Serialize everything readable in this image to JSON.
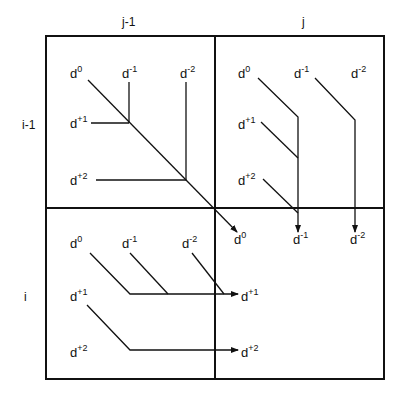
{
  "headers": {
    "columns": [
      "j-1",
      "j"
    ],
    "rows": [
      "i-1",
      "i"
    ]
  },
  "cells": {
    "top_left": {
      "labels": [
        {
          "base": "d",
          "sup": "0"
        },
        {
          "base": "d",
          "sup": "-1"
        },
        {
          "base": "d",
          "sup": "-2"
        },
        {
          "base": "d",
          "sup": "+1"
        },
        {
          "base": "d",
          "sup": "+2"
        }
      ]
    },
    "top_right": {
      "labels": [
        {
          "base": "d",
          "sup": "0"
        },
        {
          "base": "d",
          "sup": "-1"
        },
        {
          "base": "d",
          "sup": "-2"
        },
        {
          "base": "d",
          "sup": "+1"
        },
        {
          "base": "d",
          "sup": "+2"
        }
      ],
      "outputs": [
        {
          "base": "d",
          "sup": "0"
        },
        {
          "base": "d",
          "sup": "-1"
        },
        {
          "base": "d",
          "sup": "-2"
        }
      ]
    },
    "bottom_left": {
      "labels": [
        {
          "base": "d",
          "sup": "0"
        },
        {
          "base": "d",
          "sup": "-1"
        },
        {
          "base": "d",
          "sup": "-2"
        },
        {
          "base": "d",
          "sup": "+1"
        },
        {
          "base": "d",
          "sup": "+2"
        }
      ],
      "outputs": [
        {
          "base": "d",
          "sup": "+1"
        },
        {
          "base": "d",
          "sup": "+2"
        }
      ]
    },
    "bottom_right": {
      "labels": []
    }
  },
  "colors": {
    "stroke": "#111111",
    "background": "#ffffff"
  }
}
